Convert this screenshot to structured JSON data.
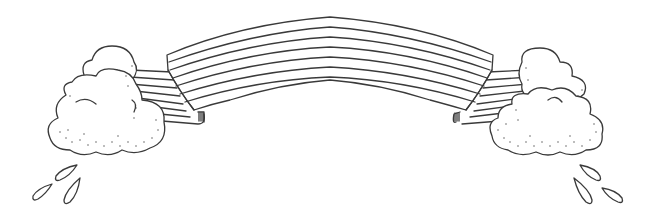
{
  "illustration": {
    "title": "Rainbow banner with clouds and raindrops",
    "style": "black line art on white",
    "colors": {
      "line": "#3a3a3a",
      "background": "#ffffff"
    },
    "banner": {
      "stripe_count": 7
    },
    "clouds": [
      {
        "side": "left"
      },
      {
        "side": "right"
      }
    ],
    "raindrops": [
      {
        "side": "left",
        "count": 3
      },
      {
        "side": "right",
        "count": 3
      }
    ]
  }
}
